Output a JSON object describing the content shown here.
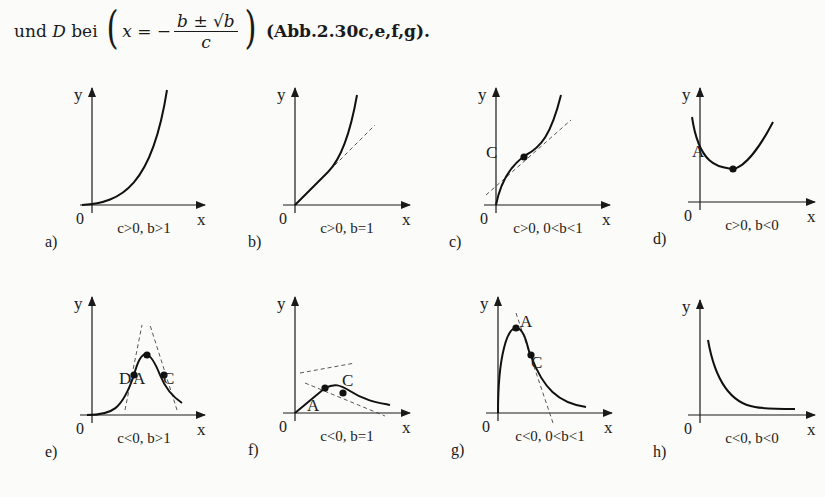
{
  "intro": {
    "prefix": "und",
    "var_D": "D",
    "bei": "bei",
    "lhs": "x = −",
    "numerator": "b ± √b",
    "denominator": "c",
    "reference": "(Abb.2.30c,e,f,g)."
  },
  "axis_labels": {
    "x": "x",
    "y": "y",
    "origin": "0"
  },
  "panels": [
    {
      "id": "a",
      "label": "a)",
      "caption": "c>0, b>1"
    },
    {
      "id": "b",
      "label": "b)",
      "caption": "c>0, b=1"
    },
    {
      "id": "c",
      "label": "c)",
      "caption": "c>0, 0<b<1",
      "points": [
        "C"
      ]
    },
    {
      "id": "d",
      "label": "d)",
      "caption": "c>0, b<0",
      "points": [
        "A"
      ]
    },
    {
      "id": "e",
      "label": "e)",
      "caption": "c<0, b>1",
      "points": [
        "D",
        "A",
        "C"
      ]
    },
    {
      "id": "f",
      "label": "f)",
      "caption": "c<0, b=1",
      "points": [
        "A",
        "C"
      ]
    },
    {
      "id": "g",
      "label": "g)",
      "caption": "c<0, 0<b<1",
      "points": [
        "A",
        "C"
      ]
    },
    {
      "id": "h",
      "label": "h)",
      "caption": "c<0, b<0"
    }
  ],
  "chart_data": [
    {
      "type": "line",
      "title": "a)",
      "subtitle": "c>0, b>1",
      "xlabel": "x",
      "ylabel": "y",
      "shape": "convex increasing from origin (flat start, steep rise)"
    },
    {
      "type": "line",
      "title": "b)",
      "subtitle": "c>0, b=1",
      "xlabel": "x",
      "ylabel": "y",
      "shape": "increasing from origin with linear start, dashed tangent line",
      "annotations": [
        "dashed tangent"
      ]
    },
    {
      "type": "line",
      "title": "c)",
      "subtitle": "c>0, 0<b<1",
      "xlabel": "x",
      "ylabel": "y",
      "shape": "increasing, steep at origin, inflection point C, dashed tangent at C",
      "annotations": [
        "C"
      ]
    },
    {
      "type": "line",
      "title": "d)",
      "subtitle": "c>0, b<0",
      "xlabel": "x",
      "ylabel": "y",
      "shape": "U-shaped with minimum A",
      "annotations": [
        "A"
      ]
    },
    {
      "type": "line",
      "title": "e)",
      "subtitle": "c<0, b>1",
      "xlabel": "x",
      "ylabel": "y",
      "shape": "bell-shaped, maximum A, inflection points D and C with dashed tangents",
      "annotations": [
        "D",
        "A",
        "C"
      ]
    },
    {
      "type": "line",
      "title": "f)",
      "subtitle": "c<0, b=1",
      "xlabel": "x",
      "ylabel": "y",
      "shape": "rises linearly from origin to maximum A then decays; inflection C; dashed tangents",
      "annotations": [
        "A",
        "C"
      ]
    },
    {
      "type": "line",
      "title": "g)",
      "subtitle": "c<0, 0<b<1",
      "xlabel": "x",
      "ylabel": "y",
      "shape": "vertical rise at origin, maximum A, inflection C, decays to 0; dashed tangent through C",
      "annotations": [
        "A",
        "C"
      ]
    },
    {
      "type": "line",
      "title": "h)",
      "subtitle": "c<0, b<0",
      "xlabel": "x",
      "ylabel": "y",
      "shape": "decreasing hyperbola-like curve approaching x-axis"
    }
  ]
}
